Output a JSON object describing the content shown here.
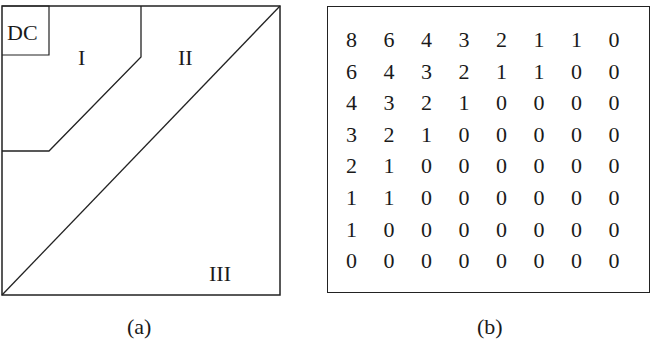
{
  "panel_a": {
    "caption": "(a)",
    "labels": {
      "dc": "DC",
      "region1": "I",
      "region2": "II",
      "region3": "III"
    }
  },
  "panel_b": {
    "caption": "(b)",
    "matrix": [
      [
        "8",
        "6",
        "4",
        "3",
        "2",
        "1",
        "1",
        "0"
      ],
      [
        "6",
        "4",
        "3",
        "2",
        "1",
        "1",
        "0",
        "0"
      ],
      [
        "4",
        "3",
        "2",
        "1",
        "0",
        "0",
        "0",
        "0"
      ],
      [
        "3",
        "2",
        "1",
        "0",
        "0",
        "0",
        "0",
        "0"
      ],
      [
        "2",
        "1",
        "0",
        "0",
        "0",
        "0",
        "0",
        "0"
      ],
      [
        "1",
        "1",
        "0",
        "0",
        "0",
        "0",
        "0",
        "0"
      ],
      [
        "1",
        "0",
        "0",
        "0",
        "0",
        "0",
        "0",
        "0"
      ],
      [
        "0",
        "0",
        "0",
        "0",
        "0",
        "0",
        "0",
        "0"
      ]
    ]
  },
  "colors": {
    "line": "#222222",
    "background": "#ffffff",
    "text": "#1a1a1a"
  }
}
